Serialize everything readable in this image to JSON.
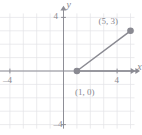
{
  "figure": {
    "kind": "coordinate-plane-graph",
    "width": 142,
    "height": 135,
    "background": "#ffffff",
    "grid_color": "#e2e2e6",
    "axis_color": "#8e8e96",
    "curve_color": "#8a8a92",
    "label_color": "#8a8a92"
  },
  "axes": {
    "x_name": "x",
    "y_name": "y",
    "x_ticks": [
      {
        "value": -4,
        "label": "–4"
      },
      {
        "value": 4,
        "label": "4"
      }
    ],
    "y_ticks": [
      {
        "value": 4,
        "label": "4"
      },
      {
        "value": -4,
        "label": "–4"
      }
    ],
    "xlim": [
      -5.2,
      5.6
    ],
    "ylim": [
      -4.8,
      4.8
    ],
    "grid": true,
    "grid_step": 1
  },
  "chart_data": {
    "type": "line",
    "title": "",
    "xlabel": "x",
    "ylabel": "y",
    "xlim": [
      -5.2,
      5.6
    ],
    "ylim": [
      -4.8,
      4.8
    ],
    "grid": true,
    "legend": "none",
    "series": [
      {
        "name": "horizontal-ray",
        "kind": "ray",
        "x": [
          1,
          5.4
        ],
        "y": [
          0,
          0
        ],
        "arrow_end": true,
        "color": "#8a8a92"
      },
      {
        "name": "rising-segment",
        "kind": "segment",
        "x": [
          1,
          5
        ],
        "y": [
          0,
          3
        ],
        "color": "#8a8a92"
      }
    ],
    "points": [
      {
        "label": "(1, 0)",
        "x": 1,
        "y": 0,
        "filled": true
      },
      {
        "label": "(5, 3)",
        "x": 5,
        "y": 3,
        "filled": true
      }
    ],
    "annotations": [
      {
        "text": "(1, 0)",
        "x": 1,
        "y": 0,
        "dx": -2,
        "dy": 26
      },
      {
        "text": "(5, 3)",
        "x": 5,
        "y": 3,
        "dx": -32,
        "dy": -5
      }
    ]
  }
}
